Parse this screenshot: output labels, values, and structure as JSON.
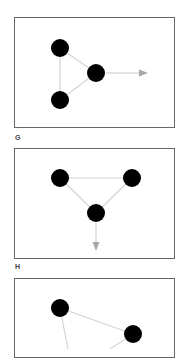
{
  "panels": [
    {
      "id": "panel-1",
      "label": "G",
      "nodes": [
        {
          "id": "n1",
          "x": 45,
          "y": 30
        },
        {
          "id": "n2",
          "x": 81,
          "y": 55
        },
        {
          "id": "n3",
          "x": 45,
          "y": 82
        }
      ],
      "edges": [
        [
          "n1",
          "n2"
        ],
        [
          "n1",
          "n3"
        ],
        [
          "n2",
          "n3"
        ]
      ],
      "arrow": {
        "from": [
          91,
          55
        ],
        "to": [
          132,
          55
        ],
        "direction": "right"
      }
    },
    {
      "id": "panel-2",
      "label": "H",
      "nodes": [
        {
          "id": "n1",
          "x": 45,
          "y": 29
        },
        {
          "id": "n2",
          "x": 117,
          "y": 29
        },
        {
          "id": "n3",
          "x": 81,
          "y": 64
        }
      ],
      "edges": [
        [
          "n1",
          "n2"
        ],
        [
          "n1",
          "n3"
        ],
        [
          "n2",
          "n3"
        ]
      ],
      "arrow": {
        "from": [
          81,
          74
        ],
        "to": [
          81,
          101
        ],
        "direction": "down"
      }
    },
    {
      "id": "panel-3",
      "label": "",
      "nodes": [
        {
          "id": "n1",
          "x": 45,
          "y": 29
        },
        {
          "id": "n2",
          "x": 118,
          "y": 55
        }
      ],
      "edges": [
        [
          "n1",
          "n2"
        ]
      ],
      "partial_edges": [
        {
          "from": [
            45,
            29
          ],
          "to": [
            53,
            70
          ]
        },
        {
          "from": [
            118,
            55
          ],
          "to": [
            95,
            70
          ]
        }
      ]
    }
  ],
  "colors": {
    "node": "#000000",
    "edge": "#d4d4d4",
    "arrow": "#a8a8a8",
    "border": "#666666"
  }
}
